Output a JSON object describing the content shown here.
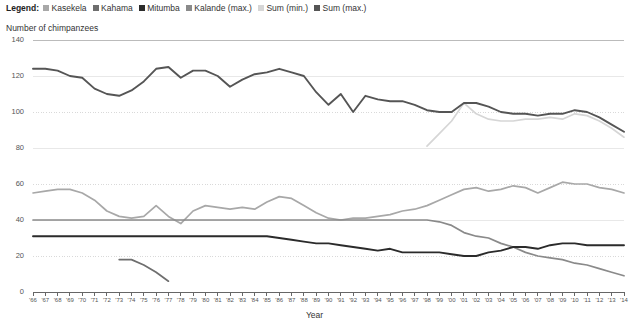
{
  "legend": {
    "title": "Legend:",
    "items": [
      {
        "label": "Kasekela",
        "color": "#a8a8a8",
        "key": "kasekela"
      },
      {
        "label": "Kahama",
        "color": "#6e6e6e",
        "key": "kahama"
      },
      {
        "label": "Mitumba",
        "color": "#2b2b2b",
        "key": "mitumba"
      },
      {
        "label": "Kalande (max.)",
        "color": "#8a8a8a",
        "key": "kalande_max"
      },
      {
        "label": "Sum (min.)",
        "color": "#d6d6d6",
        "key": "sum_min"
      },
      {
        "label": "Sum (max.)",
        "color": "#555555",
        "key": "sum_max"
      }
    ]
  },
  "axes": {
    "ylabel": "Number of chimpanzees",
    "xlabel": "Year",
    "yticks": [
      0,
      20,
      40,
      60,
      80,
      100,
      120,
      140
    ],
    "ylim": [
      0,
      140
    ],
    "xlim": [
      1966,
      2014
    ],
    "xticks": [
      "'66",
      "'67",
      "'68",
      "'69",
      "'70",
      "'71",
      "'72",
      "'73",
      "'74",
      "'75",
      "'76",
      "'77",
      "'78",
      "'79",
      "'80",
      "'81",
      "'82",
      "'83",
      "'84",
      "'85",
      "'86",
      "'87",
      "'88",
      "'89",
      "'90",
      "'91",
      "'92",
      "'93",
      "'94",
      "'95",
      "'96",
      "'97",
      "'98",
      "'99",
      "'00",
      "'01",
      "'02",
      "'03",
      "'04",
      "'05",
      "'06",
      "'07",
      "'08",
      "'09",
      "'10",
      "'11",
      "'12",
      "'13",
      "'14"
    ]
  },
  "chart_data": {
    "type": "line",
    "title": "Number of chimpanzees",
    "xlabel": "Year",
    "ylabel": "Number of chimpanzees",
    "ylim": [
      0,
      140
    ],
    "xlim": [
      1966,
      2014
    ],
    "grid": true,
    "legend_position": "top",
    "x": [
      1966,
      1967,
      1968,
      1969,
      1970,
      1971,
      1972,
      1973,
      1974,
      1975,
      1976,
      1977,
      1978,
      1979,
      1980,
      1981,
      1982,
      1983,
      1984,
      1985,
      1986,
      1987,
      1988,
      1989,
      1990,
      1991,
      1992,
      1993,
      1994,
      1995,
      1996,
      1997,
      1998,
      1999,
      2000,
      2001,
      2002,
      2003,
      2004,
      2005,
      2006,
      2007,
      2008,
      2009,
      2010,
      2011,
      2012,
      2013,
      2014
    ],
    "series": [
      {
        "name": "Sum (max.)",
        "color": "#555555",
        "values": [
          124,
          124,
          123,
          120,
          119,
          113,
          110,
          109,
          112,
          117,
          124,
          125,
          119,
          123,
          123,
          120,
          114,
          118,
          121,
          122,
          124,
          122,
          120,
          111,
          104,
          110,
          100,
          109,
          107,
          106,
          106,
          104,
          101,
          100,
          100,
          105,
          105,
          103,
          100,
          99,
          99,
          98,
          99,
          99,
          101,
          100,
          97,
          93,
          89
        ]
      },
      {
        "name": "Sum (min.)",
        "color": "#d6d6d6",
        "values": [
          null,
          null,
          null,
          null,
          null,
          null,
          null,
          null,
          null,
          null,
          null,
          null,
          null,
          null,
          null,
          null,
          null,
          null,
          null,
          null,
          null,
          null,
          null,
          null,
          null,
          null,
          null,
          null,
          null,
          null,
          null,
          null,
          81,
          88,
          95,
          105,
          99,
          96,
          95,
          95,
          96,
          96,
          97,
          96,
          99,
          98,
          95,
          91,
          86
        ]
      },
      {
        "name": "Kasekela",
        "color": "#a8a8a8",
        "values": [
          55,
          56,
          57,
          57,
          55,
          51,
          45,
          42,
          41,
          42,
          48,
          42,
          38,
          45,
          48,
          47,
          46,
          47,
          46,
          50,
          53,
          52,
          48,
          44,
          41,
          40,
          41,
          41,
          42,
          43,
          45,
          46,
          48,
          51,
          54,
          57,
          58,
          56,
          57,
          59,
          58,
          55,
          58,
          61,
          60,
          60,
          58,
          57,
          55
        ]
      },
      {
        "name": "Kalande (max.)",
        "color": "#8a8a8a",
        "values": [
          40,
          40,
          40,
          40,
          40,
          40,
          40,
          40,
          40,
          40,
          40,
          40,
          40,
          40,
          40,
          40,
          40,
          40,
          40,
          40,
          40,
          40,
          40,
          40,
          40,
          40,
          40,
          40,
          40,
          40,
          40,
          40,
          40,
          39,
          37,
          33,
          31,
          30,
          27,
          25,
          22,
          20,
          19,
          18,
          16,
          15,
          13,
          11,
          9
        ]
      },
      {
        "name": "Mitumba",
        "color": "#2b2b2b",
        "values": [
          31,
          31,
          31,
          31,
          31,
          31,
          31,
          31,
          31,
          31,
          31,
          31,
          31,
          31,
          31,
          31,
          31,
          31,
          31,
          31,
          30,
          29,
          28,
          27,
          27,
          26,
          25,
          24,
          23,
          24,
          22,
          22,
          22,
          22,
          21,
          20,
          20,
          22,
          23,
          25,
          25,
          24,
          26,
          27,
          27,
          26,
          26,
          26,
          26
        ]
      },
      {
        "name": "Kahama",
        "color": "#6e6e6e",
        "values": [
          null,
          null,
          null,
          null,
          null,
          null,
          null,
          18,
          18,
          15,
          11,
          6,
          null,
          null,
          null,
          null,
          null,
          null,
          null,
          null,
          null,
          null,
          null,
          null,
          null,
          null,
          null,
          null,
          null,
          null,
          null,
          null,
          null,
          null,
          null,
          null,
          null,
          null,
          null,
          null,
          null,
          null,
          null,
          null,
          null,
          null,
          null,
          null,
          null
        ]
      }
    ]
  },
  "colors": {
    "gridline": "#e8e8e8",
    "gridline_dotted": "#d9d9d9",
    "axis": "#666666",
    "text": "#333333"
  }
}
